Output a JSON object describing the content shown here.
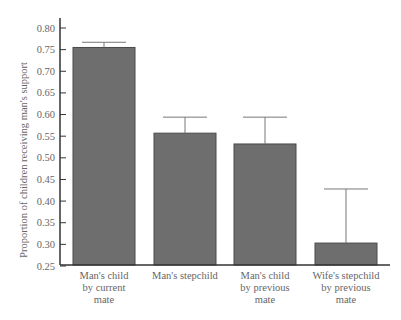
{
  "chart_data": {
    "type": "bar",
    "title": "",
    "xlabel": "",
    "ylabel": "Proportion of children receiving man's support",
    "ylim": [
      0.25,
      0.8
    ],
    "yticks": [
      0.25,
      0.3,
      0.35,
      0.4,
      0.45,
      0.5,
      0.55,
      0.6,
      0.65,
      0.7,
      0.75,
      0.8
    ],
    "ytick_labels": [
      "0.25",
      "0.30",
      "0.35",
      "0.40",
      "0.45",
      "0.50",
      "0.55",
      "0.60",
      "0.65",
      "0.70",
      "0.75",
      "0.80"
    ],
    "grid": false,
    "legend": null,
    "categories": [
      [
        "Man's child",
        "by current",
        "mate"
      ],
      [
        "Man's stepchild"
      ],
      [
        "Man's child",
        "by previous",
        "mate"
      ],
      [
        "Wife's stepchild",
        "by previous",
        "mate"
      ]
    ],
    "values": [
      0.755,
      0.557,
      0.532,
      0.303
    ],
    "error_upper": [
      0.767,
      0.594,
      0.594,
      0.428
    ],
    "error_bars": "upper only",
    "colors": {
      "bar": "#6e6e6e",
      "bar_edge": "#4a4a4a",
      "axis": "#333333",
      "error": "#777777",
      "text": "#666666"
    }
  }
}
